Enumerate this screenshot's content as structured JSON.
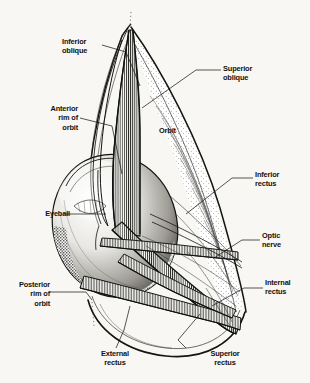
{
  "figure": {
    "style": "engraving / stipple line drawing",
    "background_color": "#f8f7f4",
    "ink_color": "#13120f"
  },
  "labels": [
    {
      "id": "inferior-oblique",
      "text": "Inferior\noblique",
      "align": "left",
      "x": 62,
      "y": 37
    },
    {
      "id": "superior-oblique",
      "text": "Superior\noblique",
      "align": "left",
      "x": 223,
      "y": 64
    },
    {
      "id": "anterior-rim",
      "text": "Anterior\nrim of\norbit",
      "align": "right",
      "x": 38,
      "y": 104
    },
    {
      "id": "orbit",
      "text": "Orbit",
      "align": "left",
      "x": 159,
      "y": 126
    },
    {
      "id": "inferior-rectus",
      "text": "Inferior\nrectus",
      "align": "left",
      "x": 255,
      "y": 170
    },
    {
      "id": "eyeball",
      "text": "Eyeball",
      "align": "right",
      "x": 30,
      "y": 209
    },
    {
      "id": "optic-nerve",
      "text": "Optic\nnerve",
      "align": "left",
      "x": 262,
      "y": 231
    },
    {
      "id": "posterior-rim",
      "text": "Posterior\nrim of\norbit",
      "align": "right",
      "x": 10,
      "y": 280
    },
    {
      "id": "internal-rectus",
      "text": "Internal\nrectus",
      "align": "left",
      "x": 265,
      "y": 278
    },
    {
      "id": "external-rectus",
      "text": "External\nrectus",
      "align": "center",
      "x": 78,
      "y": 349
    },
    {
      "id": "superior-rectus",
      "text": "Superior\nrectus",
      "align": "center",
      "x": 188,
      "y": 349
    }
  ],
  "structures": [
    "orbit cone",
    "eyeball",
    "superior oblique muscle",
    "inferior oblique muscle",
    "superior rectus muscle",
    "inferior rectus muscle",
    "internal rectus muscle",
    "external rectus muscle",
    "optic nerve",
    "anterior rim of orbit",
    "posterior rim of orbit"
  ]
}
